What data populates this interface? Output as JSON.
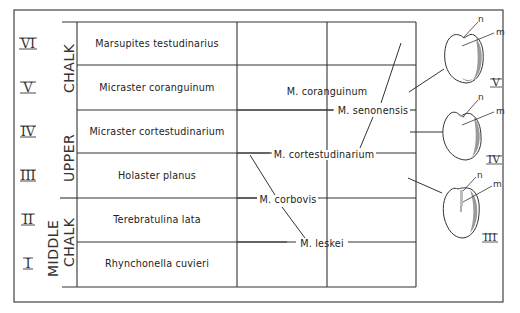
{
  "diagram": {
    "type": "stratigraphic-evolution-chart",
    "divisions": [
      {
        "label": "UPPER CHALK",
        "zones": [
          "VI",
          "V",
          "IV",
          "III"
        ]
      },
      {
        "label": "MIDDLE CHALK",
        "zones": [
          "II",
          "I"
        ]
      }
    ],
    "division_labels": {
      "upper_line1": "UPPER",
      "upper_line2": "CHALK",
      "middle_line1": "MIDDLE",
      "middle_line2": "CHALK"
    },
    "zones": [
      {
        "numeral": "VI",
        "name": "Marsupites testudinarius"
      },
      {
        "numeral": "V",
        "name": "Micraster coranguinum"
      },
      {
        "numeral": "IV",
        "name": "Micraster cortestudinarium"
      },
      {
        "numeral": "III",
        "name": "Holaster planus"
      },
      {
        "numeral": "II",
        "name": "Terebratulina lata"
      },
      {
        "numeral": "I",
        "name": "Rhynchonella cuvieri"
      }
    ],
    "species": {
      "coranguinum": "M. coranguinum",
      "senonensis": "M. senonensis",
      "cortestudinarium": "M. cortestudinarium",
      "corbovis": "M. corbovis",
      "leskei": "M. leskei"
    },
    "specimens": [
      {
        "numeral": "V",
        "labels": [
          "n",
          "m"
        ]
      },
      {
        "numeral": "IV",
        "labels": [
          "n",
          "m"
        ]
      },
      {
        "numeral": "III",
        "labels": [
          "n",
          "m"
        ]
      }
    ],
    "colors": {
      "ink": "#222222",
      "frame": "#444444",
      "shade": "#9a9a9a"
    }
  }
}
